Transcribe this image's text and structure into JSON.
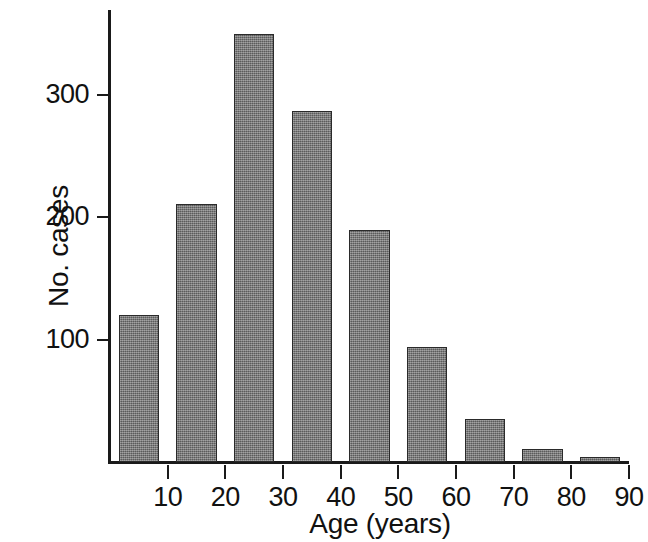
{
  "chart_data": {
    "type": "bar",
    "title": "",
    "subtitle": "",
    "xlabel": "Age (years)",
    "ylabel": "No. cases",
    "categories": [
      "0-10",
      "10-20",
      "20-30",
      "30-40",
      "40-50",
      "50-60",
      "60-70",
      "70-80",
      "80-90"
    ],
    "bin_starts": [
      0,
      10,
      20,
      30,
      40,
      50,
      60,
      70,
      80
    ],
    "bin_ends": [
      10,
      20,
      30,
      40,
      50,
      60,
      70,
      80,
      90
    ],
    "values": [
      120,
      211,
      350,
      287,
      190,
      94,
      35,
      11,
      4
    ],
    "xlim": [
      0,
      90
    ],
    "ylim": [
      0,
      360
    ],
    "x_ticks": [
      10,
      20,
      30,
      40,
      50,
      60,
      70,
      80,
      90
    ],
    "x_tick_labels": [
      "10",
      "20",
      "30",
      "40",
      "50",
      "60",
      "70",
      "80",
      "90"
    ],
    "y_ticks": [
      100,
      200,
      300
    ],
    "y_tick_labels": [
      "100",
      "200",
      "300"
    ],
    "grid": false,
    "legend": false,
    "legend_position": "none",
    "bar_color": "#6e6e6e",
    "bar_edge_color": "#2a2a2a",
    "axis_color": "#1a1a1a",
    "background_color": "#ffffff"
  },
  "figure": {
    "axis_title_x": "Age (years)",
    "axis_title_y": "No. cases"
  }
}
